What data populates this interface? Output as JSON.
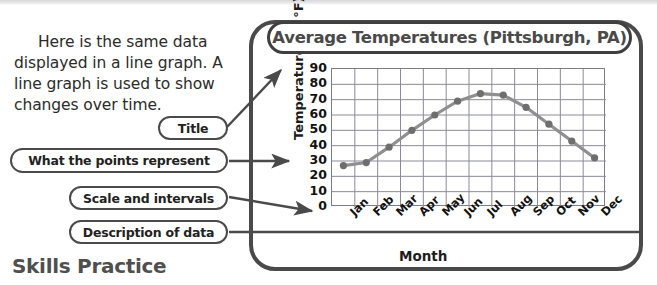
{
  "page": {
    "intro_paragraph": "Here is the same data displayed in a line graph. A line graph is used to show changes over time.",
    "section_heading": "Skills Practice"
  },
  "callouts": [
    {
      "id": "title",
      "label": "Title"
    },
    {
      "id": "points",
      "label": "What the points represent"
    },
    {
      "id": "scale",
      "label": "Scale and intervals"
    },
    {
      "id": "description",
      "label": "Description of data"
    }
  ],
  "colors": {
    "line": "#8f8f8f",
    "marker": "#6e6e6e",
    "grid": "#8a8a99",
    "frame_border": "#4a4a4a",
    "text": "#222222",
    "heading": "#4f4f4f"
  },
  "chart_data": {
    "type": "line",
    "title": "Average Temperatures (Pittsburgh, PA)",
    "xlabel": "Month",
    "ylabel": "Temperature (in °F)",
    "categories": [
      "Jan",
      "Feb",
      "Mar",
      "Apr",
      "May",
      "Jun",
      "Jul",
      "Aug",
      "Sep",
      "Oct",
      "Nov",
      "Dec"
    ],
    "values": [
      27,
      29,
      39,
      50,
      60,
      69,
      74,
      73,
      65,
      54,
      43,
      32
    ],
    "ylim": [
      0,
      90
    ],
    "ytick_step": 10,
    "yticks": [
      90,
      80,
      70,
      60,
      50,
      40,
      30,
      20,
      10,
      0
    ],
    "grid": true,
    "legend": "none",
    "marker": "circle",
    "series_name": "Average Temperature"
  }
}
